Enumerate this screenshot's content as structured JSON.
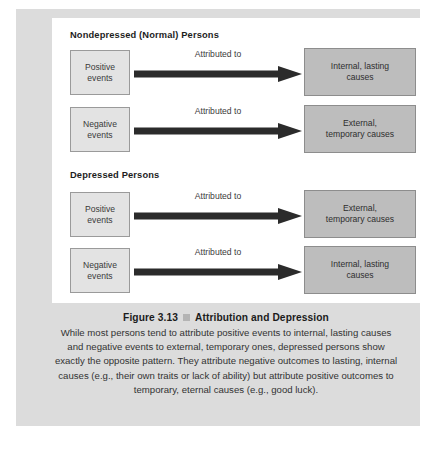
{
  "figure": {
    "groups": [
      {
        "heading": "Nondepressed (Normal) Persons",
        "rows": [
          {
            "source_line1": "Positive",
            "source_line2": "events",
            "arrow_label": "Attributed to",
            "target_line1": "Internal, lasting",
            "target_line2": "causes"
          },
          {
            "source_line1": "Negative",
            "source_line2": "events",
            "arrow_label": "Attributed to",
            "target_line1": "External,",
            "target_line2": "temporary causes"
          }
        ]
      },
      {
        "heading": "Depressed Persons",
        "rows": [
          {
            "source_line1": "Positive",
            "source_line2": "events",
            "arrow_label": "Attributed to",
            "target_line1": "External,",
            "target_line2": "temporary causes"
          },
          {
            "source_line1": "Negative",
            "source_line2": "events",
            "arrow_label": "Attributed to",
            "target_line1": "Internal, lasting",
            "target_line2": "causes"
          }
        ]
      }
    ],
    "caption": {
      "number": "Figure 3.13",
      "title": "Attribution and Depression",
      "body": "While most persons tend to attribute positive events to internal, lasting causes and negative events to external, temporary ones, depressed persons show exactly the opposite pattern. They attribute negative outcomes to lasting, internal causes (e.g., their own traits or lack of ability) but attribute positive outcomes to temporary, eternal causes (e.g., good luck)."
    },
    "colors": {
      "panel_background": "#dcdcdc",
      "diagram_background": "#ffffff",
      "source_box_fill": "#e3e3e3",
      "source_box_border": "#9a9a9a",
      "target_box_fill": "#bdbdbd",
      "target_box_border": "#8d8d8d",
      "arrow_fill": "#2b2b2b",
      "caption_bullet": "#b4b4b4"
    }
  }
}
